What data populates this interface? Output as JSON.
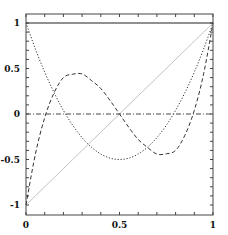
{
  "chart_data": {
    "type": "line",
    "title": "",
    "xlabel": "",
    "ylabel": "",
    "xlim": [
      0,
      1
    ],
    "ylim": [
      -1.1,
      1.1
    ],
    "grid": false,
    "legend": null,
    "x_ticks": [
      {
        "value": 0,
        "label": "0"
      },
      {
        "value": 0.5,
        "label": "0.5"
      },
      {
        "value": 1,
        "label": "1"
      }
    ],
    "y_ticks": [
      {
        "value": 1,
        "label": "1"
      },
      {
        "value": 0.5,
        "label": "0.5"
      },
      {
        "value": 0,
        "label": "0"
      },
      {
        "value": -0.5,
        "label": "-0.5"
      },
      {
        "value": -1,
        "label": "-1"
      }
    ],
    "minor_tick_step_x": 0.1,
    "minor_tick_step_y": 0.1,
    "x": [
      0,
      0.05,
      0.1,
      0.15,
      0.2,
      0.25,
      0.3,
      0.35,
      0.4,
      0.45,
      0.5,
      0.55,
      0.6,
      0.65,
      0.7,
      0.75,
      0.8,
      0.85,
      0.9,
      0.95,
      1
    ],
    "series": [
      {
        "name": "P0 (constant)",
        "style": "solid",
        "width": 1.2,
        "color": "#222222",
        "values": [
          1,
          1,
          1,
          1,
          1,
          1,
          1,
          1,
          1,
          1,
          1,
          1,
          1,
          1,
          1,
          1,
          1,
          1,
          1,
          1,
          1
        ]
      },
      {
        "name": "P1 (linear)",
        "style": "thin",
        "width": 0.6,
        "color": "#999999",
        "values": [
          -1,
          -0.9,
          -0.8,
          -0.7,
          -0.6,
          -0.5,
          -0.4,
          -0.3,
          -0.2,
          -0.1,
          0,
          0.1,
          0.2,
          0.3,
          0.4,
          0.5,
          0.6,
          0.7,
          0.8,
          0.9,
          1
        ]
      },
      {
        "name": "P2 (quadratic)",
        "style": "dotted",
        "width": 1,
        "color": "#333333",
        "values": [
          1,
          0.715,
          0.46,
          0.235,
          0.04,
          -0.125,
          -0.26,
          -0.365,
          -0.44,
          -0.485,
          -0.5,
          -0.485,
          -0.44,
          -0.365,
          -0.26,
          -0.125,
          0.04,
          0.235,
          0.46,
          0.715,
          1
        ]
      },
      {
        "name": "P3 (cubic)",
        "style": "dashed",
        "width": 1,
        "color": "#333333",
        "values": [
          -1,
          -0.4425,
          -0.04,
          0.2325,
          0.4,
          0.4375,
          0.44,
          0.3675,
          0.28,
          0.1475,
          0,
          -0.1475,
          -0.28,
          -0.3675,
          -0.44,
          -0.4375,
          -0.4,
          -0.2325,
          0.04,
          0.4425,
          1
        ]
      },
      {
        "name": "zero line",
        "style": "dashdot",
        "width": 1,
        "color": "#444444",
        "values": [
          0,
          0,
          0,
          0,
          0,
          0,
          0,
          0,
          0,
          0,
          0,
          0,
          0,
          0,
          0,
          0,
          0,
          0,
          0,
          0,
          0
        ]
      }
    ]
  },
  "layout": {
    "x0_px": 26,
    "x1_px": 213,
    "yTop_px": 14,
    "yBottom_px": 215,
    "yPlus1_px": 23,
    "yMinus1_px": 205
  }
}
